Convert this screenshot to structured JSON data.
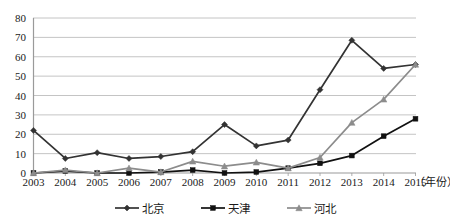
{
  "chart_data": {
    "type": "line",
    "title": "",
    "xlabel": "年份",
    "ylabel": "",
    "ylim": [
      0,
      80
    ],
    "ytick_step": 10,
    "grid": true,
    "legend_position": "bottom",
    "x_unit_label": "（年份）",
    "categories": [
      "2003",
      "2004",
      "2005",
      "2006",
      "2007",
      "2008",
      "2009",
      "2010",
      "2011",
      "2012",
      "2013",
      "2014",
      "2015"
    ],
    "ytick_labels": [
      "0",
      "10",
      "20",
      "30",
      "40",
      "50",
      "60",
      "70",
      "80"
    ],
    "series": [
      {
        "name": "北京",
        "color": "#333333",
        "marker": "diamond",
        "values": [
          22,
          7.5,
          10.5,
          7.5,
          8.5,
          11,
          25,
          14,
          17,
          43,
          68.5,
          54,
          56
        ]
      },
      {
        "name": "天津",
        "color": "#111111",
        "marker": "square",
        "values": [
          0,
          1,
          0,
          0,
          0.5,
          1.5,
          0,
          0.5,
          2.5,
          5,
          9,
          19,
          28
        ]
      },
      {
        "name": "河北",
        "color": "#8c8c8c",
        "marker": "triangle",
        "values": [
          0,
          1.5,
          0,
          2.5,
          0.5,
          6,
          3.5,
          5.5,
          2.5,
          8,
          26,
          38,
          56
        ]
      }
    ]
  },
  "axis": {
    "axis_color": "#9a9a9a",
    "grid_color": "#b5b5b5",
    "tick_color": "#1a1a1a"
  }
}
